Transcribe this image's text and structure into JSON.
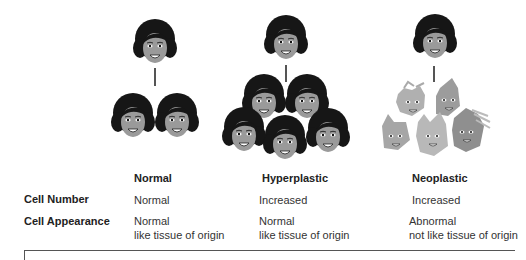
{
  "columns": [
    {
      "id": "normal",
      "header": "Normal"
    },
    {
      "id": "hyperplastic",
      "header": "Hyperplastic"
    },
    {
      "id": "neoplastic",
      "header": "Neoplastic"
    }
  ],
  "rows": [
    {
      "label": "Cell Number",
      "values": [
        [
          "Normal"
        ],
        [
          "Increased"
        ],
        [
          "Increased"
        ]
      ]
    },
    {
      "label": "Cell Appearance",
      "values": [
        [
          "Normal",
          "like tissue of origin"
        ],
        [
          "Normal",
          "like tissue of origin"
        ],
        [
          "Abnormal",
          "not like tissue of origin"
        ]
      ]
    }
  ],
  "illustration": {
    "normal": {
      "parent_cells": 1,
      "daughter_cells": 2,
      "cell_style": "normal-face"
    },
    "hyperplastic": {
      "parent_cells": 1,
      "daughter_cells": 5,
      "cell_style": "normal-face"
    },
    "neoplastic": {
      "parent_cells": 1,
      "daughter_cells": 5,
      "cell_style": "distorted-face"
    }
  },
  "colors": {
    "hair": "#161616",
    "skin": "#9a9a9a",
    "abnormal_skin": "#a8a8a8",
    "line": "#555555",
    "text": "#222222"
  }
}
